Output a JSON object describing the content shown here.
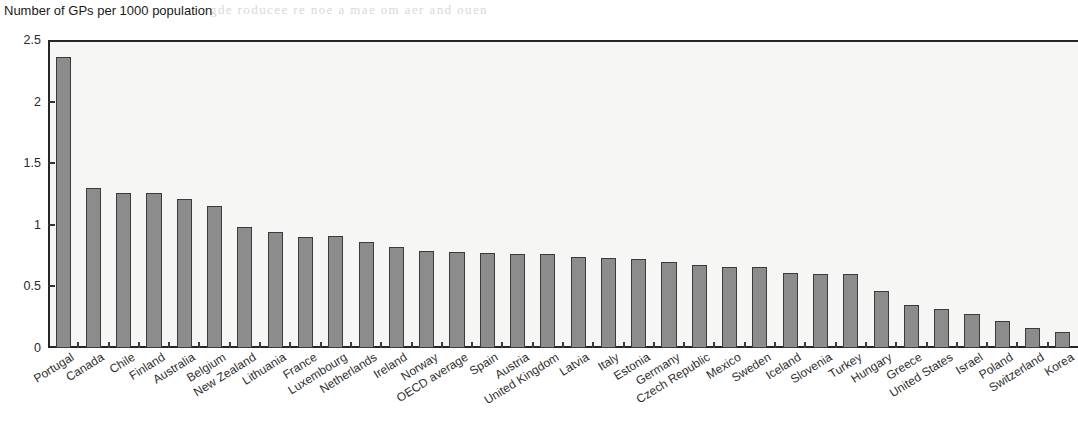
{
  "chart_data": {
    "type": "bar",
    "title": "Number of GPs per 1000 population",
    "xlabel": "",
    "ylabel": "",
    "ylim": [
      0,
      2.5
    ],
    "ytick_labels": [
      "0",
      "0.5",
      "1",
      "1.5",
      "2",
      "2.5"
    ],
    "ytick_values": [
      0,
      0.5,
      1,
      1.5,
      2,
      2.5
    ],
    "grid": false,
    "legend": "none",
    "bar_color": "#8c8c8c",
    "bar_edge_color": "#3b3b3b",
    "categories": [
      "Portugal",
      "Canada",
      "Chile",
      "Finland",
      "Australia",
      "Belgium",
      "New Zealand",
      "Lithuania",
      "France",
      "Luxembourg",
      "Netherlands",
      "Ireland",
      "Norway",
      "OECD average",
      "Spain",
      "Austria",
      "United Kingdom",
      "Latvia",
      "Italy",
      "Estonia",
      "Germany",
      "Czech Republic",
      "Mexico",
      "Sweden",
      "Iceland",
      "Slovenia",
      "Turkey",
      "Hungary",
      "Greece",
      "United States",
      "Israel",
      "Poland",
      "Switzerland",
      "Korea"
    ],
    "values": [
      2.36,
      1.3,
      1.26,
      1.26,
      1.21,
      1.15,
      0.98,
      0.94,
      0.9,
      0.91,
      0.86,
      0.82,
      0.79,
      0.78,
      0.77,
      0.76,
      0.76,
      0.74,
      0.73,
      0.72,
      0.7,
      0.67,
      0.66,
      0.66,
      0.61,
      0.6,
      0.6,
      0.46,
      0.35,
      0.32,
      0.28,
      0.22,
      0.16,
      0.13
    ]
  },
  "artifacts": {
    "bleed_top": "gde  roducee   re  noe  a   mae   om  aer  and  ouen",
    "bleed_mid": "uar   eare  a   no  r   ae  ar   nere   an  ane",
    "bleed_right": "ole  a"
  }
}
